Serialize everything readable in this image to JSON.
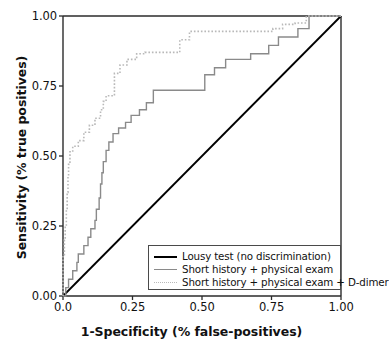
{
  "chart_data": {
    "type": "line",
    "title": "",
    "xlabel": "1-Specificity (% false-positives)",
    "ylabel": "Sensitivity (% true positives)",
    "xlim": [
      0,
      1
    ],
    "ylim": [
      0,
      1
    ],
    "grid": false,
    "legend_position": "lower-right",
    "xticks": [
      "0.0",
      "0.25",
      "0.50",
      "0.75",
      "1.00"
    ],
    "xtick_values": [
      0,
      0.25,
      0.5,
      0.75,
      1.0
    ],
    "yticks": [
      "0.00",
      "0.25",
      "0.50",
      "0.75",
      "1.00"
    ],
    "ytick_values": [
      0,
      0.25,
      0.5,
      0.75,
      1.0
    ],
    "series": [
      {
        "name": "Lousy test (no discrimination)",
        "style": "solid",
        "color": "#000000",
        "width": 1.8,
        "points": [
          [
            0,
            0
          ],
          [
            1,
            1
          ]
        ]
      },
      {
        "name": "Short history + physical exam",
        "style": "solid",
        "color": "#8a8a8a",
        "width": 1.4,
        "points": [
          [
            0.0,
            0.0
          ],
          [
            0.01,
            0.0
          ],
          [
            0.01,
            0.03
          ],
          [
            0.02,
            0.03
          ],
          [
            0.02,
            0.06
          ],
          [
            0.035,
            0.06
          ],
          [
            0.035,
            0.09
          ],
          [
            0.05,
            0.09
          ],
          [
            0.05,
            0.12
          ],
          [
            0.055,
            0.12
          ],
          [
            0.055,
            0.15
          ],
          [
            0.075,
            0.15
          ],
          [
            0.075,
            0.18
          ],
          [
            0.09,
            0.18
          ],
          [
            0.09,
            0.21
          ],
          [
            0.1,
            0.21
          ],
          [
            0.1,
            0.24
          ],
          [
            0.115,
            0.24
          ],
          [
            0.115,
            0.27
          ],
          [
            0.12,
            0.27
          ],
          [
            0.12,
            0.31
          ],
          [
            0.13,
            0.31
          ],
          [
            0.13,
            0.35
          ],
          [
            0.135,
            0.35
          ],
          [
            0.135,
            0.4
          ],
          [
            0.14,
            0.4
          ],
          [
            0.14,
            0.44
          ],
          [
            0.145,
            0.44
          ],
          [
            0.145,
            0.48
          ],
          [
            0.155,
            0.48
          ],
          [
            0.155,
            0.52
          ],
          [
            0.165,
            0.52
          ],
          [
            0.165,
            0.55
          ],
          [
            0.18,
            0.55
          ],
          [
            0.18,
            0.58
          ],
          [
            0.2,
            0.58
          ],
          [
            0.2,
            0.6
          ],
          [
            0.225,
            0.6
          ],
          [
            0.225,
            0.62
          ],
          [
            0.245,
            0.62
          ],
          [
            0.245,
            0.645
          ],
          [
            0.275,
            0.645
          ],
          [
            0.275,
            0.665
          ],
          [
            0.3,
            0.665
          ],
          [
            0.3,
            0.69
          ],
          [
            0.325,
            0.69
          ],
          [
            0.325,
            0.735
          ],
          [
            0.51,
            0.735
          ],
          [
            0.51,
            0.79
          ],
          [
            0.545,
            0.79
          ],
          [
            0.545,
            0.815
          ],
          [
            0.585,
            0.815
          ],
          [
            0.585,
            0.845
          ],
          [
            0.675,
            0.845
          ],
          [
            0.675,
            0.865
          ],
          [
            0.74,
            0.865
          ],
          [
            0.74,
            0.895
          ],
          [
            0.775,
            0.895
          ],
          [
            0.775,
            0.925
          ],
          [
            0.845,
            0.925
          ],
          [
            0.845,
            0.955
          ],
          [
            0.885,
            0.955
          ],
          [
            0.885,
            1.0
          ],
          [
            1.0,
            1.0
          ]
        ]
      },
      {
        "name": "Short history + physical exam + D-dimer",
        "style": "dotted",
        "color": "#b9b9b9",
        "width": 1.6,
        "points": [
          [
            0.0,
            0.0
          ],
          [
            0.0,
            0.145
          ],
          [
            0.005,
            0.145
          ],
          [
            0.005,
            0.2
          ],
          [
            0.008,
            0.2
          ],
          [
            0.008,
            0.25
          ],
          [
            0.012,
            0.25
          ],
          [
            0.012,
            0.31
          ],
          [
            0.015,
            0.31
          ],
          [
            0.015,
            0.37
          ],
          [
            0.018,
            0.37
          ],
          [
            0.018,
            0.43
          ],
          [
            0.02,
            0.43
          ],
          [
            0.02,
            0.47
          ],
          [
            0.025,
            0.47
          ],
          [
            0.025,
            0.515
          ],
          [
            0.035,
            0.515
          ],
          [
            0.035,
            0.535
          ],
          [
            0.055,
            0.535
          ],
          [
            0.055,
            0.555
          ],
          [
            0.075,
            0.555
          ],
          [
            0.075,
            0.585
          ],
          [
            0.095,
            0.585
          ],
          [
            0.095,
            0.61
          ],
          [
            0.115,
            0.61
          ],
          [
            0.115,
            0.635
          ],
          [
            0.135,
            0.635
          ],
          [
            0.135,
            0.665
          ],
          [
            0.145,
            0.665
          ],
          [
            0.145,
            0.695
          ],
          [
            0.155,
            0.695
          ],
          [
            0.155,
            0.715
          ],
          [
            0.185,
            0.715
          ],
          [
            0.185,
            0.795
          ],
          [
            0.205,
            0.795
          ],
          [
            0.205,
            0.825
          ],
          [
            0.23,
            0.825
          ],
          [
            0.23,
            0.845
          ],
          [
            0.265,
            0.845
          ],
          [
            0.265,
            0.865
          ],
          [
            0.295,
            0.865
          ],
          [
            0.295,
            0.87
          ],
          [
            0.42,
            0.87
          ],
          [
            0.42,
            0.915
          ],
          [
            0.455,
            0.915
          ],
          [
            0.455,
            0.945
          ],
          [
            0.755,
            0.945
          ],
          [
            0.755,
            0.955
          ],
          [
            0.79,
            0.955
          ],
          [
            0.79,
            0.97
          ],
          [
            0.835,
            0.97
          ],
          [
            0.835,
            0.975
          ],
          [
            0.875,
            0.975
          ],
          [
            0.875,
            1.0
          ],
          [
            1.0,
            1.0
          ]
        ]
      }
    ]
  },
  "axes": {
    "xtick_labels": [
      "0.0",
      "0.25",
      "0.50",
      "0.75",
      "1.00"
    ],
    "ytick_labels": [
      "0.00",
      "0.25",
      "0.50",
      "0.75",
      "1.00"
    ]
  },
  "legend": {
    "items": [
      {
        "label": "Lousy test (no discrimination)",
        "swatch": "solid-black"
      },
      {
        "label": "Short history + physical exam",
        "swatch": "solid-gray"
      },
      {
        "label": "Short history + physical exam + D-dimer",
        "swatch": "dotted-gray"
      }
    ]
  },
  "colors": {
    "axis": "#2b2b2b",
    "reference_line": "#000000",
    "series_gray": "#8a8a8a",
    "series_dotted": "#b9b9b9",
    "text": "#111111",
    "background": "#ffffff"
  }
}
